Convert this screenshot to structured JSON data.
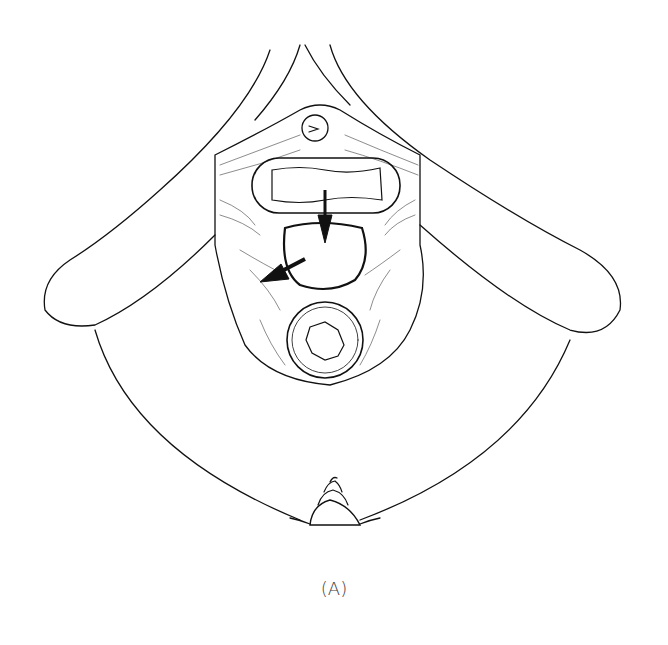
{
  "figure": {
    "caption": "(A)",
    "parts": [
      {
        "name": "urethral-opening"
      },
      {
        "name": "vaginal-opening"
      },
      {
        "name": "defect-opening"
      },
      {
        "name": "anal-opening"
      },
      {
        "name": "umbilicus"
      },
      {
        "name": "arrow-down"
      },
      {
        "name": "arrow-left"
      }
    ],
    "colors": {
      "line": "#111111",
      "background": "#ffffff"
    }
  }
}
